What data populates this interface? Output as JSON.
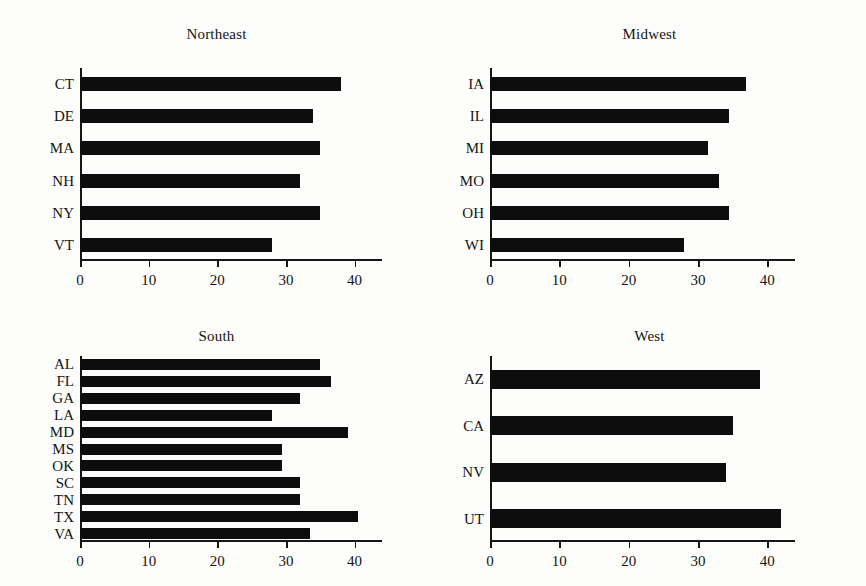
{
  "figure": {
    "background": "#fdfdfb",
    "bar_color": "#0d0d0d",
    "axis_color": "#161616"
  },
  "chart_data": [
    {
      "type": "bar",
      "orientation": "horizontal",
      "title": "Northeast",
      "xlabel": "",
      "ylabel": "",
      "categories": [
        "CT",
        "DE",
        "MA",
        "NH",
        "NY",
        "VT"
      ],
      "values": [
        38.0,
        34.0,
        35.0,
        32.0,
        35.0,
        28.0
      ],
      "xlim": [
        0,
        44
      ],
      "xticks": [
        0,
        10,
        20,
        30,
        40
      ],
      "xticklabels": [
        "0",
        "10",
        "20",
        "30",
        "40"
      ],
      "grid": false,
      "legend": "none"
    },
    {
      "type": "bar",
      "orientation": "horizontal",
      "title": "Midwest",
      "xlabel": "",
      "ylabel": "",
      "categories": [
        "IA",
        "IL",
        "MI",
        "MO",
        "OH",
        "WI"
      ],
      "values": [
        37.0,
        34.5,
        31.5,
        33.0,
        34.5,
        28.0
      ],
      "xlim": [
        0,
        44
      ],
      "xticks": [
        0,
        10,
        20,
        30,
        40
      ],
      "xticklabels": [
        "0",
        "10",
        "20",
        "30",
        "40"
      ],
      "grid": false,
      "legend": "none"
    },
    {
      "type": "bar",
      "orientation": "horizontal",
      "title": "South",
      "xlabel": "",
      "ylabel": "",
      "categories": [
        "AL",
        "FL",
        "GA",
        "LA",
        "MD",
        "MS",
        "OK",
        "SC",
        "TN",
        "TX",
        "VA"
      ],
      "values": [
        35.0,
        36.5,
        32.0,
        28.0,
        39.0,
        29.5,
        29.5,
        32.0,
        32.0,
        40.5,
        33.5
      ],
      "xlim": [
        0,
        44
      ],
      "xticks": [
        0,
        10,
        20,
        30,
        40
      ],
      "xticklabels": [
        "0",
        "10",
        "20",
        "30",
        "40"
      ],
      "grid": false,
      "legend": "none"
    },
    {
      "type": "bar",
      "orientation": "horizontal",
      "title": "West",
      "xlabel": "",
      "ylabel": "",
      "categories": [
        "AZ",
        "CA",
        "NV",
        "UT"
      ],
      "values": [
        39.0,
        35.0,
        34.0,
        42.0
      ],
      "xlim": [
        0,
        44
      ],
      "xticks": [
        0,
        10,
        20,
        30,
        40
      ],
      "xticklabels": [
        "0",
        "10",
        "20",
        "30",
        "40"
      ],
      "grid": false,
      "legend": "none"
    }
  ]
}
